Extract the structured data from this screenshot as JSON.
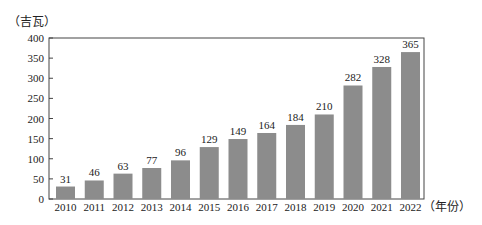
{
  "chart_data": {
    "type": "bar",
    "title": "",
    "xlabel": "（年份）",
    "ylabel": "（吉瓦）",
    "categories": [
      "2010",
      "2011",
      "2012",
      "2013",
      "2014",
      "2015",
      "2016",
      "2017",
      "2018",
      "2019",
      "2020",
      "2021",
      "2022"
    ],
    "values": [
      31,
      46,
      63,
      77,
      96,
      129,
      149,
      164,
      184,
      210,
      282,
      328,
      365
    ],
    "data_labels": [
      "31",
      "46",
      "63",
      "77",
      "96",
      "129",
      "149",
      "164",
      "184",
      "210",
      "282",
      "328",
      "365"
    ],
    "ylim": [
      0,
      400
    ],
    "yticks": [
      0,
      50,
      100,
      150,
      200,
      250,
      300,
      350,
      400
    ],
    "grid": false,
    "legend": null,
    "bar_color": "#8c8c8c"
  }
}
